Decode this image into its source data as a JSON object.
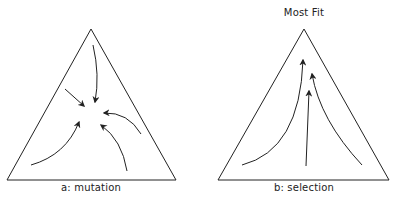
{
  "panels": [
    {
      "id": "a",
      "caption": "a: mutation",
      "apex_label": "",
      "arrow_direction": "converging to center"
    },
    {
      "id": "b",
      "caption": "b: selection",
      "apex_label": "Most Fit",
      "arrow_direction": "toward apex"
    }
  ],
  "colors": {
    "line": "#222222",
    "background": "#ffffff"
  }
}
